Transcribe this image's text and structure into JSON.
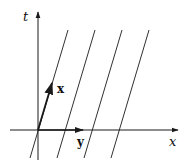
{
  "diagram": {
    "axes": {
      "vertical_label": "t",
      "horizontal_label": "x"
    },
    "vectors": {
      "x_label": "x",
      "y_label": "y"
    },
    "parallel_lines_count": 4,
    "colors": {
      "stroke": "#1a1a1a",
      "background": "#ffffff"
    }
  }
}
